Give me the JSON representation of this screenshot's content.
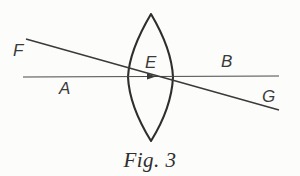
{
  "figure": {
    "caption": "Fig. 3",
    "background_color": "#fcfcfa",
    "ink_color": "#2e2e2e",
    "labels": {
      "F": "F",
      "A": "A",
      "E": "E",
      "B": "B",
      "G": "G"
    },
    "elements": {
      "lens_name": "biconvex-lens",
      "axis_name": "optical-axis",
      "ray_name": "oblique-ray",
      "arrow_name": "axis-direction-arrow"
    },
    "geometry": {
      "lens": {
        "top_vertex": [
          151,
          14
        ],
        "bottom_vertex": [
          151,
          141
        ],
        "left_bulge_x": 128,
        "right_bulge_x": 173,
        "mid_y": 77
      },
      "axis": {
        "start": [
          23,
          77
        ],
        "end": [
          279,
          76
        ]
      },
      "ray": {
        "start": [
          26,
          39
        ],
        "end": [
          279,
          110
        ]
      },
      "intersection_point": [
        150,
        76
      ]
    }
  }
}
